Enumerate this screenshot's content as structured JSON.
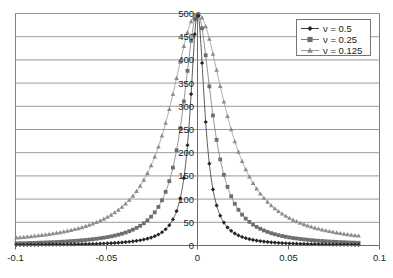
{
  "chart_data": {
    "type": "line",
    "title": "",
    "subtitle": "",
    "xlabel": "",
    "ylabel": "",
    "xlim": [
      -0.1,
      0.1
    ],
    "ylim": [
      0,
      500
    ],
    "grid": true,
    "grid_axis": "y",
    "legend_position": "top-right",
    "x_ticks": [
      "-0.1",
      "-0.05",
      "0",
      "0.05",
      "0.1"
    ],
    "x_tick_values": [
      -0.1,
      -0.05,
      0,
      0.05,
      0.1
    ],
    "y_ticks": [
      "0",
      "50",
      "100",
      "150",
      "200",
      "250",
      "300",
      "350",
      "400",
      "450",
      "500"
    ],
    "y_tick_values": [
      0,
      50,
      100,
      150,
      200,
      250,
      300,
      350,
      400,
      450,
      500
    ],
    "x": [
      -0.0995,
      -0.0975,
      -0.0955,
      -0.0935,
      -0.0915,
      -0.0895,
      -0.0875,
      -0.0855,
      -0.0835,
      -0.0815,
      -0.0795,
      -0.0775,
      -0.0755,
      -0.0735,
      -0.0715,
      -0.0695,
      -0.0675,
      -0.0655,
      -0.0635,
      -0.0615,
      -0.0595,
      -0.0575,
      -0.0555,
      -0.0535,
      -0.0515,
      -0.0495,
      -0.0475,
      -0.0455,
      -0.0435,
      -0.0415,
      -0.0395,
      -0.0375,
      -0.0355,
      -0.0335,
      -0.0315,
      -0.0295,
      -0.0275,
      -0.0255,
      -0.0235,
      -0.0215,
      -0.0195,
      -0.0175,
      -0.0155,
      -0.0135,
      -0.0115,
      -0.0095,
      -0.0075,
      -0.0055,
      -0.0035,
      -0.0015,
      0.0005,
      0.0025,
      0.0045,
      0.0065,
      0.0085,
      0.0105,
      0.0125,
      0.0145,
      0.0165,
      0.0185,
      0.0205,
      0.0225,
      0.0245,
      0.0265,
      0.0285,
      0.0305,
      0.0325,
      0.0345,
      0.0365,
      0.0385,
      0.0405,
      0.0425,
      0.0445,
      0.0465,
      0.0485,
      0.0505,
      0.0525,
      0.0545,
      0.0565,
      0.0585,
      0.0605,
      0.0625,
      0.0645,
      0.0665,
      0.0685,
      0.0705,
      0.0725,
      0.0745,
      0.0765,
      0.0785,
      0.0805,
      0.0825,
      0.0845,
      0.0865,
      0.0885
    ],
    "series": [
      {
        "name": "v = 0.5",
        "label": "ν = 0.5",
        "nu": 0.5,
        "marker": "diamond",
        "color": "#262626",
        "formula": "Lorentzian: A*g/(x^2+g^2), half-width g=0.0048, peak 500",
        "half_width": 0.0048,
        "peak": 500
      },
      {
        "name": "v = 0.25",
        "label": "ν = 0.25",
        "nu": 0.25,
        "marker": "square",
        "color": "#6e6e6e",
        "formula": "Lorentzian: A*g/(x^2+g^2), half-width g=0.0096, peak 500",
        "half_width": 0.0096,
        "peak": 500
      },
      {
        "name": "v = 0.125",
        "label": "ν = 0.125",
        "nu": 0.125,
        "marker": "triangle",
        "color": "#8c8c8c",
        "formula": "Lorentzian: A*g/(x^2+g^2), half-width g=0.0185, peak 500",
        "half_width": 0.0185,
        "peak": 500
      }
    ]
  },
  "legend": {
    "entries": [
      {
        "label": "ν = 0.5",
        "marker": "diamond",
        "color": "#262626"
      },
      {
        "label": "ν = 0.25",
        "marker": "square",
        "color": "#6e6e6e"
      },
      {
        "label": "ν = 0.125",
        "marker": "triangle",
        "color": "#8c8c8c"
      }
    ]
  },
  "axes": {
    "x_labels": [
      "-0.1",
      "-0.05",
      "0",
      "0.05",
      "0.1"
    ],
    "y_labels": [
      "0",
      "50",
      "100",
      "150",
      "200",
      "250",
      "300",
      "350",
      "400",
      "450",
      "500"
    ]
  },
  "colors": {
    "plot_border": "#808080",
    "gridline": "#9a9a9a",
    "axis_line": "#6b6b6b",
    "background": "#ffffff",
    "series_1": "#262626",
    "series_2": "#6e6e6e",
    "series_3": "#8c8c8c"
  }
}
